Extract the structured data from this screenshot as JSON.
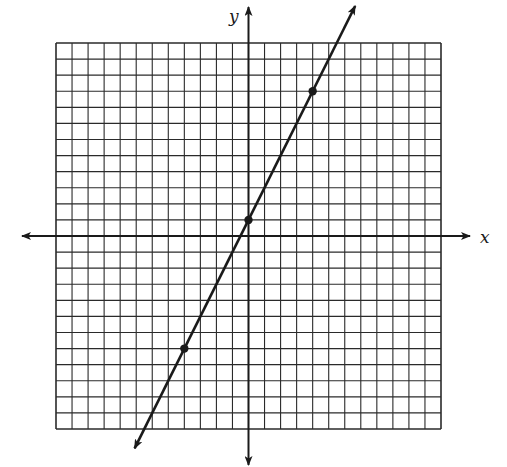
{
  "chart_data": {
    "type": "line",
    "title": "",
    "xlabel": "x",
    "ylabel": "y",
    "xlim": [
      -12,
      12
    ],
    "ylim": [
      -12,
      12
    ],
    "grid": true,
    "grid_cells": {
      "x": 24,
      "y": 24
    },
    "tick_labels": [],
    "legend": null,
    "equation": "y = 2x + 1",
    "series": [
      {
        "name": "line",
        "slope": 2,
        "intercept": 1,
        "arrows_both_ends": true,
        "points": [
          {
            "x": -4,
            "y": -7
          },
          {
            "x": 0,
            "y": 1
          },
          {
            "x": 4,
            "y": 9
          }
        ]
      }
    ]
  },
  "labels": {
    "x_axis": "x",
    "y_axis": "y"
  },
  "colors": {
    "ink": "#1a1a1a",
    "grid": "#2a2a2a",
    "background": "#ffffff"
  }
}
